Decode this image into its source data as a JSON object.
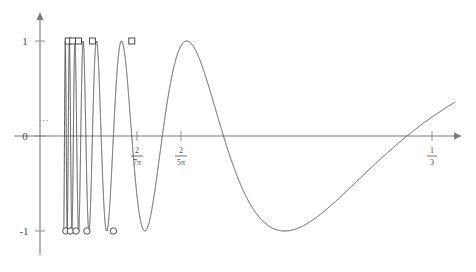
{
  "figure": {
    "title": "",
    "background_color": "#ffffff",
    "curve_color": "#4a4a4a",
    "axis_color": "#7a7a7a"
  },
  "chart_data": {
    "type": "line",
    "title": "",
    "xlabel": "",
    "ylabel": "",
    "function": "sin(1/x)",
    "grid": false,
    "legend": false,
    "xlim": [
      0,
      0.36
    ],
    "ylim": [
      -1.25,
      1.25
    ],
    "x_ticks": [
      {
        "value": 0.09095,
        "label_numerator": "2",
        "label_denominator": "7π"
      },
      {
        "value": 0.12732,
        "label_numerator": "2",
        "label_denominator": "5π"
      },
      {
        "value": 0.33333,
        "label_numerator": "1",
        "label_denominator": "3"
      }
    ],
    "y_ticks": [
      {
        "value": 1,
        "label": "1"
      },
      {
        "value": 0,
        "label": "0"
      },
      {
        "value": -1,
        "label": "-1"
      }
    ],
    "maxima_markers": {
      "shape": "square",
      "y": 1,
      "x": [
        0.0245,
        0.0283,
        0.0334,
        0.0455,
        0.0796
      ]
    },
    "minima_markers": {
      "shape": "circle",
      "y": -1,
      "x": [
        0.0224,
        0.0263,
        0.0313,
        0.0407,
        0.0637
      ]
    },
    "annotations": [
      {
        "text": "⋯",
        "x": 0.006,
        "y": 0.22,
        "name": "oscillation-ellipsis"
      }
    ]
  }
}
